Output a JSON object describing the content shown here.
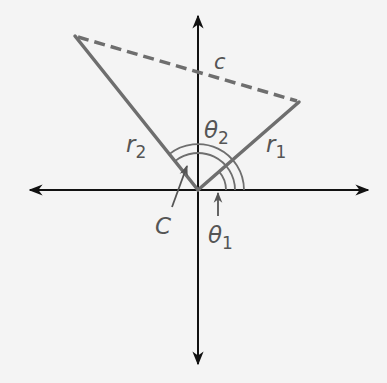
{
  "diagram": {
    "type": "polar-coordinate vectors with law of cosines",
    "origin": {
      "x": 198,
      "y": 190
    },
    "axes": {
      "x_axis": {
        "from": [
          28,
          190
        ],
        "to": [
          370,
          190
        ],
        "arrows": "both"
      },
      "y_axis": {
        "from": [
          198,
          366
        ],
        "to": [
          198,
          14
        ],
        "arrows": "both"
      }
    },
    "segments": [
      {
        "name": "r1",
        "label": "r",
        "subscript": "1",
        "from": [
          198,
          190
        ],
        "to": [
          299,
          102
        ],
        "style": "solid"
      },
      {
        "name": "r2",
        "label": "r",
        "subscript": "2",
        "from": [
          198,
          190
        ],
        "to": [
          75,
          36
        ],
        "style": "solid"
      },
      {
        "name": "c",
        "label": "c",
        "from": [
          75,
          36
        ],
        "to": [
          299,
          102
        ],
        "style": "dashed"
      }
    ],
    "angles": [
      {
        "name": "theta1",
        "label": "θ",
        "subscript": "1",
        "description": "angle from positive x-axis to r1"
      },
      {
        "name": "theta2",
        "label": "θ",
        "subscript": "2",
        "description": "angle from positive x-axis to r2"
      },
      {
        "name": "C",
        "label": "C",
        "description": "angle between r1 and r2"
      }
    ],
    "colors": {
      "axis": "#111111",
      "segment": "#6e6e6e",
      "label": "#555555",
      "background": "#f4f4f4"
    }
  },
  "labels": {
    "c": "c",
    "r1_main": "r",
    "r1_sub": "1",
    "r2_main": "r",
    "r2_sub": "2",
    "theta2_main": "θ",
    "theta2_sub": "2",
    "theta1_main": "θ",
    "theta1_sub": "1",
    "C": "C"
  }
}
